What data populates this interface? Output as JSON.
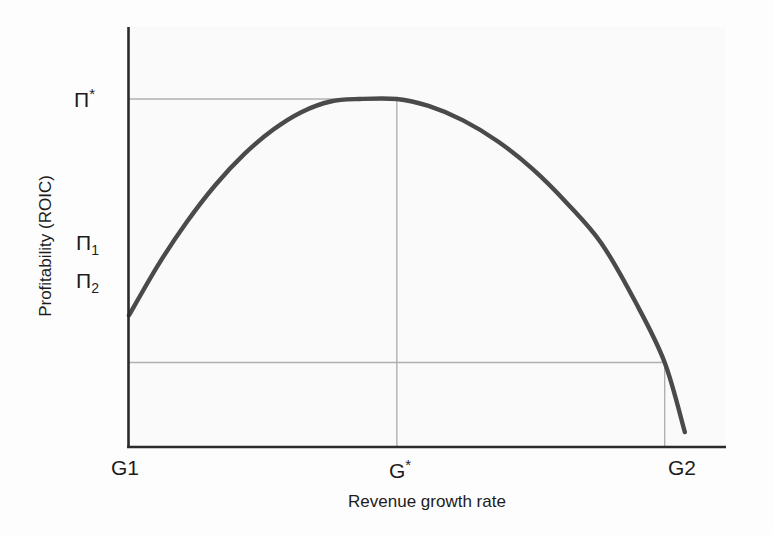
{
  "chart_data": {
    "type": "line",
    "title": "",
    "subtitle": "",
    "xlabel": "Revenue growth rate",
    "ylabel": "Profitability (ROIC)",
    "grid": true,
    "legend": null,
    "x_tick_labels": [
      "G1",
      "G*",
      "G2"
    ],
    "y_tick_labels": [
      "Π*",
      "Π₁",
      "Π₂"
    ],
    "x_tick_values": [
      0,
      0.465,
      0.93
    ],
    "y_tick_values": [
      1.0,
      0.565,
      0.47
    ],
    "xlim": [
      0,
      1
    ],
    "ylim": [
      0,
      1.2
    ],
    "annotations": [
      {
        "name": "pi-star-gridline",
        "label": "Π*",
        "kind": "horizontal-reference",
        "y": 1.0,
        "x_from": 0,
        "x_to": 0.465
      },
      {
        "name": "pi-two-gridline",
        "label": "Π₂",
        "kind": "horizontal-reference",
        "y": 0.47,
        "x_from": 0,
        "x_to": 0.93
      },
      {
        "name": "g-star-gridline",
        "label": "G*",
        "kind": "vertical-reference",
        "x": 0.465,
        "y_from": 0,
        "y_to": 1.0
      },
      {
        "name": "g-two-gridline",
        "label": "G2",
        "kind": "vertical-reference",
        "x": 0.93,
        "y_from": 0,
        "y_to": 0.47
      }
    ],
    "series": [
      {
        "name": "Profitability curve",
        "color": "#4a4a4a",
        "line_width": 4,
        "x": [
          0.0,
          0.05,
          0.1,
          0.15,
          0.2,
          0.25,
          0.3,
          0.35,
          0.4,
          0.465,
          0.52,
          0.58,
          0.64,
          0.7,
          0.76,
          0.82,
          0.88,
          0.93,
          0.965
        ],
        "y": [
          0.565,
          0.665,
          0.752,
          0.827,
          0.889,
          0.938,
          0.974,
          0.995,
          1.0,
          1.0,
          0.986,
          0.957,
          0.915,
          0.86,
          0.791,
          0.71,
          0.59,
          0.47,
          0.33
        ]
      }
    ],
    "key_points": [
      {
        "name": "start-point",
        "label": "Π₁ at G1",
        "x": 0.0,
        "y": 0.565
      },
      {
        "name": "peak-point",
        "label": "Π* at G*",
        "x": 0.465,
        "y": 1.0
      },
      {
        "name": "crossing-point",
        "label": "Π₂ at G2",
        "x": 0.93,
        "y": 0.47
      },
      {
        "name": "end-point",
        "label": "curve end",
        "x": 0.965,
        "y": 0.33
      }
    ]
  },
  "axes": {
    "y_title": "Profitability (ROIC)",
    "x_title": "Revenue growth rate",
    "y_ticks": [
      {
        "id": "pi-star",
        "text": "Π",
        "sup": "*",
        "sub": ""
      },
      {
        "id": "pi-one",
        "text": "Π",
        "sup": "",
        "sub": "1"
      },
      {
        "id": "pi-two",
        "text": "Π",
        "sup": "",
        "sub": "2"
      }
    ],
    "x_ticks": [
      {
        "id": "g-one",
        "text": "G1",
        "sup": ""
      },
      {
        "id": "g-star",
        "text": "G",
        "sup": "*"
      },
      {
        "id": "g-two",
        "text": "G2",
        "sup": ""
      }
    ]
  },
  "colors": {
    "curve": "#4a4a4a",
    "axis": "#2b2b2b",
    "gridline": "#b0b0b0",
    "text": "#1c1c1c",
    "plot_background": "#fafafa",
    "page_background": "#fdfdfd"
  }
}
